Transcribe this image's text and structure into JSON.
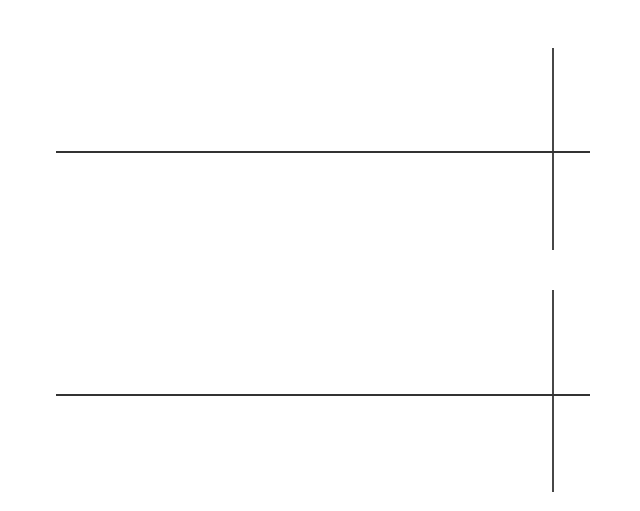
{
  "figure": {
    "panels": [
      {
        "id": "top",
        "description": "Shaded region between two wavy boundary curves inside a parabolic envelope",
        "labels": {
          "source": "S",
          "x_axis": "x",
          "y_axis": "y"
        },
        "colors": {
          "shade": "#d9d9d9",
          "line": "#444444",
          "axis": "#333333"
        },
        "axis_y": 152,
        "envelope_path": "M553,70 C420,74 230,90 130,118 C80,132 62,144 66,154 C70,168 110,188 190,200 C300,214 430,226 553,233",
        "upper_wave_path": "M66,154 C68,134 90,124 110,124 C140,124 165,140 182,155 C190,161 198,160 205,155 C235,130 265,92 310,88 C345,85 370,112 400,113 C430,114 450,88 480,78 C505,71 530,70 553,70",
        "lower_wave_path": "M72,163 C82,155 95,151 105,152 C140,154 160,196 182,198 C205,201 235,165 260,155 C280,148 310,148 330,155 C355,168 380,183 405,183 C440,183 490,162 540,152",
        "shade_path": "M66,154 C68,134 90,124 110,124 C140,124 165,140 182,155 C190,161 198,160 205,155 C235,130 265,92 310,88 C345,85 370,112 400,113 C430,114 450,88 480,78 C505,71 530,70 553,70 L553,152 L540,152 C490,162 440,183 405,183 C380,183 355,168 330,155 C310,148 280,148 260,155 C235,165 205,201 182,198 C160,196 140,154 105,152 C95,151 82,155 72,163 Z"
      },
      {
        "id": "bottom",
        "description": "Same wavy region covered by a chain of overlapping ellipses",
        "labels": {
          "source": "S",
          "x_axis": "x",
          "y_axis": "y"
        },
        "colors": {
          "ellipse": "#9a9a9a",
          "line": "#444444",
          "axis": "#333333"
        },
        "axis_y": 395,
        "ellipses": [
          {
            "cx": 107,
            "cy": 383,
            "rx": 19,
            "ry": 16
          },
          {
            "cx": 122,
            "cy": 389,
            "rx": 18,
            "ry": 19
          },
          {
            "cx": 160,
            "cy": 406,
            "rx": 25,
            "ry": 20
          },
          {
            "cx": 245,
            "cy": 416,
            "rx": 27,
            "ry": 24
          },
          {
            "cx": 278,
            "cy": 371,
            "rx": 27,
            "ry": 25
          },
          {
            "cx": 342,
            "cy": 367,
            "rx": 49,
            "ry": 42
          },
          {
            "cx": 486,
            "cy": 364,
            "rx": 52,
            "ry": 47
          },
          {
            "cx": 540,
            "cy": 350,
            "rx": 36,
            "ry": 48
          }
        ]
      }
    ]
  }
}
